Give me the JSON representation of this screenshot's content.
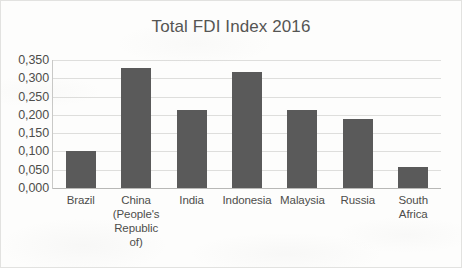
{
  "chart_data": {
    "type": "bar",
    "title": "Total FDI Index 2016",
    "xlabel": "",
    "ylabel": "",
    "categories": [
      "Brazil",
      "China (People's Republic of)",
      "India",
      "Indonesia",
      "Malaysia",
      "Russia",
      "South Africa"
    ],
    "category_labels_wrapped": [
      "Brazil",
      "China\n(People's\nRepublic\nof)",
      "India",
      "Indonesia",
      "Malaysia",
      "Russia",
      "South\nAfrica"
    ],
    "values": [
      0.1,
      0.328,
      0.213,
      0.317,
      0.213,
      0.19,
      0.057
    ],
    "ylim": [
      0,
      0.35
    ],
    "ytick_values": [
      0.35,
      0.3,
      0.25,
      0.2,
      0.15,
      0.1,
      0.05,
      0.0
    ],
    "ytick_labels": [
      "0,350",
      "0,300",
      "0,250",
      "0,200",
      "0,150",
      "0,100",
      "0,050",
      "0,000"
    ],
    "decimal_separator": ",",
    "grid": true,
    "grid_axis": "y",
    "legend": false,
    "legend_position": "none",
    "series": [
      {
        "name": "Total FDI Index 2016",
        "values": [
          0.1,
          0.328,
          0.213,
          0.317,
          0.213,
          0.19,
          0.057
        ]
      }
    ],
    "colors": {
      "bar": "#5a5a5a",
      "gridline": "#dededc",
      "axis": "#b8b8b6",
      "title_text": "#555553",
      "tick_text": "#4d4d4b",
      "plot_background": "#fdfdfc",
      "frame_border": "#e2e2e0"
    }
  }
}
